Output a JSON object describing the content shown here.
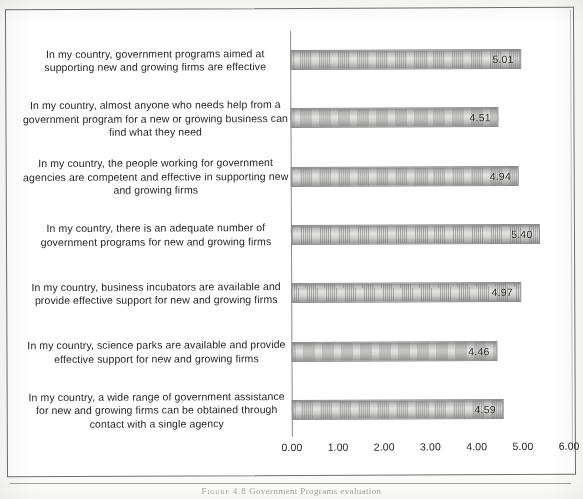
{
  "figure": {
    "caption_label": "Figure 4.8",
    "caption_text": "Government Programs evaluation"
  },
  "chart_data": {
    "type": "bar",
    "orientation": "horizontal",
    "title": "",
    "xlabel": "",
    "ylabel": "",
    "xlim": [
      0,
      6
    ],
    "xticks": [
      "0.00",
      "1.00",
      "2.00",
      "3.00",
      "4.00",
      "5.00",
      "6.00"
    ],
    "xtick_values": [
      0,
      1,
      2,
      3,
      4,
      5,
      6
    ],
    "grid": false,
    "legend": false,
    "categories": [
      "In my country, government programs aimed at supporting new and growing firms are effective",
      "In my country, almost anyone who needs help from a government program for a new or growing business can find what they need",
      "In my country, the people working for government agencies are competent and effective in supporting new and growing firms",
      "In my country, there is an adequate number of government programs for new and growing firms",
      "In my country, business incubators are available and provide effective support for new and growing firms",
      "In my country, science parks are available and provide effective support for new and growing firms",
      "In my country, a wide range of government assistance for new and growing firms can be obtained through contact with a single agency"
    ],
    "values": [
      5.01,
      4.51,
      4.94,
      5.4,
      4.97,
      4.46,
      4.59
    ],
    "value_labels": [
      "5.01",
      "4.51",
      "4.94",
      "5.40",
      "4.97",
      "4.46",
      "4.59"
    ],
    "bar_color": "#cfcfcd",
    "bar_border_color": "#8d8d8d",
    "axis_color": "#8a8a8a"
  }
}
